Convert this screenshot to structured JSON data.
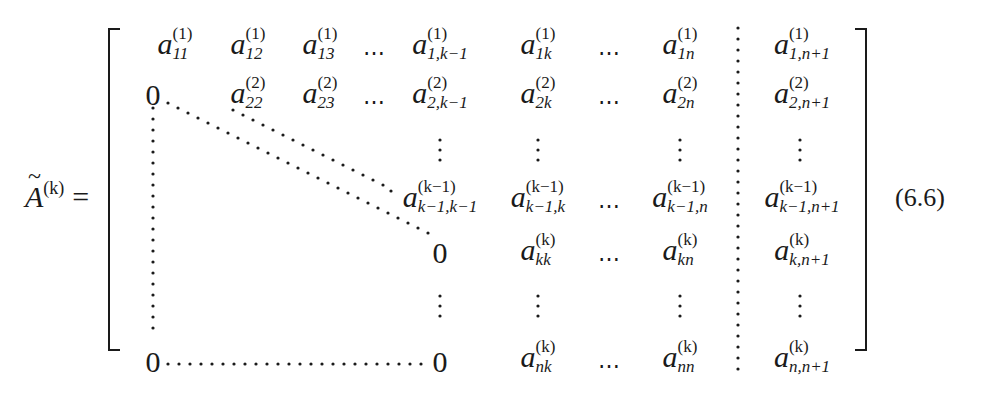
{
  "equation": {
    "lhs": {
      "symbol": "A",
      "accent": "~",
      "superscript": "(k)",
      "relation": "="
    },
    "number": "(6.6)",
    "matrix": {
      "rows": [
        [
          {
            "base": "a",
            "sup": "(1)",
            "sub": "11"
          },
          {
            "base": "a",
            "sup": "(1)",
            "sub": "12"
          },
          {
            "base": "a",
            "sup": "(1)",
            "sub": "13"
          },
          {
            "hdots": "⋯"
          },
          {
            "base": "a",
            "sup": "(1)",
            "sub": "1,k−1"
          },
          {
            "base": "a",
            "sup": "(1)",
            "sub": "1k"
          },
          {
            "hdots": "⋯"
          },
          {
            "base": "a",
            "sup": "(1)",
            "sub": "1n"
          },
          {
            "base": "a",
            "sup": "(1)",
            "sub": "1,n+1"
          }
        ],
        [
          {
            "plain": "0"
          },
          {
            "base": "a",
            "sup": "(2)",
            "sub": "22"
          },
          {
            "base": "a",
            "sup": "(2)",
            "sub": "23"
          },
          {
            "hdots": "⋯"
          },
          {
            "base": "a",
            "sup": "(2)",
            "sub": "2,k−1"
          },
          {
            "base": "a",
            "sup": "(2)",
            "sub": "2k"
          },
          {
            "hdots": "⋯"
          },
          {
            "base": "a",
            "sup": "(2)",
            "sub": "2n"
          },
          {
            "base": "a",
            "sup": "(2)",
            "sub": "2,n+1"
          }
        ],
        [
          {
            "base": "a",
            "sup": "(k−1)",
            "sub": "k−1,k−1"
          },
          {
            "base": "a",
            "sup": "(k−1)",
            "sub": "k−1,k"
          },
          {
            "hdots": "⋯"
          },
          {
            "base": "a",
            "sup": "(k−1)",
            "sub": "k−1,n"
          },
          {
            "base": "a",
            "sup": "(k−1)",
            "sub": "k−1,n+1"
          }
        ],
        [
          {
            "plain": "0"
          },
          {
            "base": "a",
            "sup": "(k)",
            "sub": "kk"
          },
          {
            "hdots": "⋯"
          },
          {
            "base": "a",
            "sup": "(k)",
            "sub": "kn"
          },
          {
            "base": "a",
            "sup": "(k)",
            "sub": "k,n+1"
          }
        ],
        [
          {
            "plain": "0"
          },
          {
            "plain": "0"
          },
          {
            "base": "a",
            "sup": "(k)",
            "sub": "nk"
          },
          {
            "hdots": "⋯"
          },
          {
            "base": "a",
            "sup": "(k)",
            "sub": "nn"
          },
          {
            "base": "a",
            "sup": "(k)",
            "sub": "n,n+1"
          }
        ]
      ]
    }
  }
}
